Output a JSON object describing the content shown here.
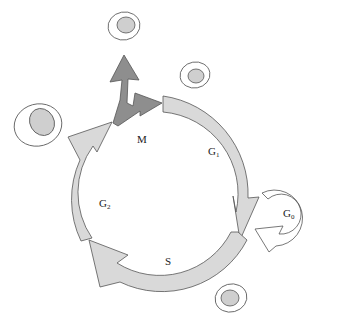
{
  "diagram": {
    "type": "cell-cycle",
    "phases": [
      {
        "id": "M",
        "label": "M",
        "sub": "",
        "color": "#8c8c8c"
      },
      {
        "id": "G1",
        "label": "G",
        "sub": "1",
        "color": "#d6d6d6"
      },
      {
        "id": "S",
        "label": "S",
        "sub": "",
        "color": "#d6d6d6"
      },
      {
        "id": "G2",
        "label": "G",
        "sub": "2",
        "color": "#d6d6d6"
      },
      {
        "id": "G0",
        "label": "G",
        "sub": "0",
        "color": "#ffffff"
      }
    ],
    "cells": [
      {
        "id": "daughter-cell-top",
        "desc": "daughter cell"
      },
      {
        "id": "daughter-cell-right",
        "desc": "daughter cell"
      },
      {
        "id": "large-cell-left",
        "desc": "grown cell before mitosis"
      },
      {
        "id": "quiescent-cell-bottom",
        "desc": "cell"
      }
    ],
    "colors": {
      "stroke": "#555555",
      "arc_fill": "#d9d9d9",
      "mitosis_fill": "#8e8e8e",
      "nucleus_fill": "#cfcfcf",
      "g0_fill": "#ffffff"
    }
  }
}
